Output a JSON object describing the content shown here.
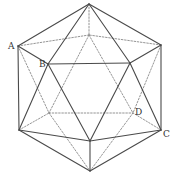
{
  "figure": {
    "colors": {
      "solid_edge": "#4a4a4a",
      "hidden_edge": "#7a7a7a",
      "label": "#333333",
      "background": "#ffffff"
    },
    "vertices": {
      "T": {
        "x": 89,
        "y": 4
      },
      "A": {
        "x": 18,
        "y": 46
      },
      "R1": {
        "x": 161,
        "y": 45
      },
      "B": {
        "x": 48,
        "y": 64
      },
      "F2": {
        "x": 130,
        "y": 63
      },
      "K1": {
        "x": 89,
        "y": 35
      },
      "K2": {
        "x": 49,
        "y": 113
      },
      "D": {
        "x": 133,
        "y": 113
      },
      "L2": {
        "x": 19,
        "y": 130
      },
      "C": {
        "x": 161,
        "y": 130
      },
      "F3": {
        "x": 90,
        "y": 141
      },
      "Bt": {
        "x": 90,
        "y": 171
      }
    },
    "labels": [
      {
        "text": "A",
        "x": 8,
        "y": 49
      },
      {
        "text": "B",
        "x": 39,
        "y": 67
      },
      {
        "text": "D",
        "x": 135,
        "y": 115
      },
      {
        "text": "C",
        "x": 163,
        "y": 137
      }
    ],
    "solid_edges": [
      [
        "T",
        "A"
      ],
      [
        "T",
        "R1"
      ],
      [
        "T",
        "B"
      ],
      [
        "T",
        "F2"
      ],
      [
        "A",
        "B"
      ],
      [
        "A",
        "L2"
      ],
      [
        "B",
        "L2"
      ],
      [
        "B",
        "F2"
      ],
      [
        "B",
        "F3"
      ],
      [
        "F2",
        "R1"
      ],
      [
        "F2",
        "F3"
      ],
      [
        "F2",
        "C"
      ],
      [
        "R1",
        "C"
      ],
      [
        "L2",
        "F3"
      ],
      [
        "F3",
        "C"
      ],
      [
        "L2",
        "Bt"
      ],
      [
        "F3",
        "Bt"
      ],
      [
        "C",
        "Bt"
      ]
    ],
    "hidden_edges": [
      [
        "T",
        "K1"
      ],
      [
        "A",
        "K1"
      ],
      [
        "R1",
        "K1"
      ],
      [
        "K1",
        "K2"
      ],
      [
        "K1",
        "D"
      ],
      [
        "K2",
        "D"
      ],
      [
        "A",
        "K2"
      ],
      [
        "L2",
        "K2"
      ],
      [
        "K2",
        "Bt"
      ],
      [
        "R1",
        "D"
      ],
      [
        "C",
        "D"
      ],
      [
        "D",
        "Bt"
      ]
    ]
  }
}
